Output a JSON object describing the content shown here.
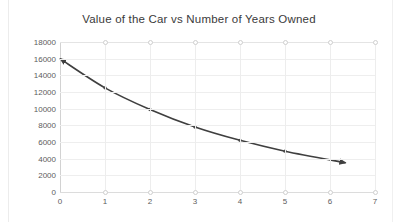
{
  "chart_data": {
    "type": "line",
    "title": "Value of the Car vs Number of Years Owned",
    "xlabel": "",
    "ylabel": "",
    "xlim": [
      0,
      7
    ],
    "ylim": [
      0,
      18000
    ],
    "grid": true,
    "legend": false,
    "x": [
      0,
      1,
      2,
      3,
      4,
      5,
      6.35
    ],
    "values": [
      16000,
      12500,
      9900,
      7800,
      6200,
      4900,
      3500
    ],
    "series": [
      {
        "name": "Value of the Car",
        "x": [
          0,
          1,
          2,
          3,
          4,
          5,
          6.35
        ],
        "values": [
          16000,
          12500,
          9900,
          7800,
          6200,
          4900,
          3500
        ],
        "marker_x": [
          1,
          2,
          3,
          4,
          5
        ],
        "marker_values": [
          12500,
          9900,
          7800,
          6200,
          4900
        ],
        "color": "#3f3f3f",
        "arrow_start": true,
        "arrow_end": true
      }
    ],
    "y_ticks": [
      0,
      2000,
      4000,
      6000,
      8000,
      10000,
      12000,
      14000,
      16000,
      18000
    ],
    "y_tick_labels": [
      "0",
      "2000",
      "4000",
      "6000",
      "8000",
      "10000",
      "12000",
      "14000",
      "16000",
      "18000"
    ],
    "x_ticks": [
      0,
      1,
      2,
      3,
      4,
      5,
      6,
      7
    ],
    "x_tick_labels": [
      "0",
      "1",
      "2",
      "3",
      "4",
      "5",
      "6",
      "7"
    ],
    "open_markers_top_x": [
      1,
      2,
      3,
      4,
      5,
      6,
      7
    ],
    "open_markers_top_value": 18000,
    "open_markers_bottom_x": [
      1,
      2,
      3,
      4,
      5,
      6,
      7
    ],
    "open_markers_bottom_value": 0,
    "colors": {
      "curve": "#3f3f3f",
      "grid": "#eeeeee",
      "axis": "#d2d2d2",
      "tick_text": "#5c5c5c",
      "title_text": "#3a3a3a",
      "open_marker_stroke": "#cfcfcf",
      "background": "#ffffff"
    }
  }
}
